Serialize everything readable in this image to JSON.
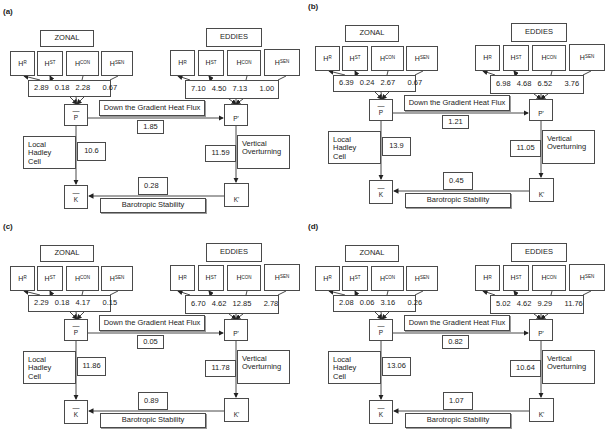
{
  "common": {
    "zonal_label": "ZONAL",
    "eddies_label": "EDDIES",
    "h_terms": [
      {
        "base": "H",
        "sub": "R"
      },
      {
        "base": "H",
        "sub": "ST"
      },
      {
        "base": "H",
        "sub": "CON"
      },
      {
        "base": "H",
        "sub": "SEN"
      }
    ],
    "zonal_P": {
      "bar": "—",
      "label": "P"
    },
    "eddy_P": {
      "label": "P'"
    },
    "zonal_K": {
      "bar": "—",
      "label": "K"
    },
    "eddy_K": {
      "label": "K'"
    },
    "gradient_flux_label": "Down the Gradient Heat Flux",
    "hadley_label_line1": "Local Hadley",
    "hadley_label_line2": "Cell",
    "vertical_label_line1": "Vertical",
    "vertical_label_line2": "Overturning",
    "barotropic_label": "Barotropic Stability"
  },
  "panels": [
    {
      "id": "a",
      "label": "(a)",
      "zonal_values": [
        "2.89",
        "0.18",
        "2.28",
        "0.67"
      ],
      "eddy_values": [
        "7.10",
        "4.50",
        "7.13",
        "1.00"
      ],
      "gradient_flux": "1.85",
      "hadley": "10.6",
      "vertical": "11.59",
      "barotropic": "0.28"
    },
    {
      "id": "b",
      "label": "(b)",
      "zonal_values": [
        "6.39",
        "0.24",
        "2.67",
        "0.67"
      ],
      "eddy_values": [
        "6.98",
        "4.68",
        "6.52",
        "3.76"
      ],
      "gradient_flux": "1.21",
      "hadley": "13.9",
      "vertical": "11.05",
      "barotropic": "0.45"
    },
    {
      "id": "c",
      "label": "(c)",
      "zonal_values": [
        "2.29",
        "0.18",
        "4.17",
        "0.15"
      ],
      "eddy_values": [
        "6.70",
        "4.62",
        "12.85",
        "2.78"
      ],
      "gradient_flux": "0.05",
      "hadley": "11.86",
      "vertical": "11.78",
      "barotropic": "0.89"
    },
    {
      "id": "d",
      "label": "(d)",
      "zonal_values": [
        "2.08",
        "0.06",
        "3.16",
        "0.26"
      ],
      "eddy_values": [
        "5.02",
        "4.62",
        "9.29",
        "11.76"
      ],
      "gradient_flux": "0.82",
      "hadley": "13.06",
      "vertical": "10.64",
      "barotropic": "1.07"
    }
  ]
}
